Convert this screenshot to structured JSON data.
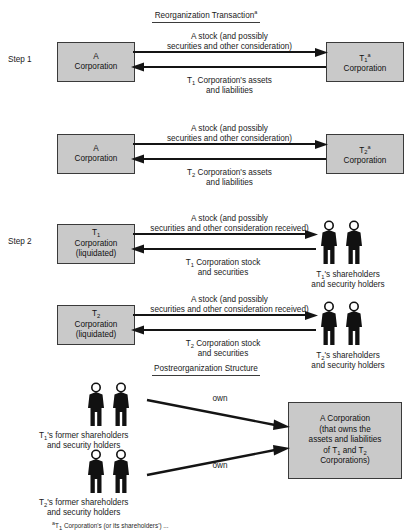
{
  "diagram": {
    "title_top": "Reorganization Transaction",
    "title_top_mark": "a",
    "title_bottom": "Postreorganization Structure",
    "step1_label": "Step 1",
    "step2_label": "Step 2"
  },
  "boxes": {
    "a_corp_1": {
      "line1": "A",
      "line2": "Corporation"
    },
    "a_corp_2": {
      "line1": "A",
      "line2": "Corporation"
    },
    "t1_corp": {
      "line1_base": "T",
      "line1_sub": "1",
      "line1_mark": "a",
      "line2": "Corporation"
    },
    "t2_corp": {
      "line1_base": "T",
      "line1_sub": "2",
      "line1_mark": "a",
      "line2": "Corporation"
    },
    "t1_liq": {
      "line1_base": "T",
      "line1_sub": "1",
      "line2": "Corporation",
      "line3": "(liquidated)"
    },
    "t2_liq": {
      "line1_base": "T",
      "line1_sub": "2",
      "line2": "Corporation",
      "line3": "(liquidated)"
    },
    "a_corp_post": {
      "line1": "A Corporation",
      "line2": "(that owns the",
      "line3": "assets and liabilities",
      "line4_pre": "of T",
      "line4_sub1": "1",
      "line4_mid": " and T",
      "line4_sub2": "2",
      "line5": "Corporations)"
    }
  },
  "captions": {
    "row1_top_l1": "A stock (and possibly",
    "row1_top_l2": "securities and other consideration)",
    "row1_bottom_l1_pre": "T",
    "row1_bottom_l1_sub": "1",
    "row1_bottom_l1_post": " Corporation's assets",
    "row1_bottom_l2": "and liabilities",
    "row2_top_l1": "A stock (and possibly",
    "row2_top_l2": "securities and other consideration)",
    "row2_bottom_l1_pre": "T",
    "row2_bottom_l1_sub": "2",
    "row2_bottom_l1_post": " Corporation's assets",
    "row2_bottom_l2": "and liabilities",
    "row3_top_l1": "A stock (and possibly",
    "row3_top_l2": "securities and other consideration received)",
    "row3_bottom_l1_pre": "T",
    "row3_bottom_l1_sub": "1",
    "row3_bottom_l1_post": " Corporation stock",
    "row3_bottom_l2": "and securities",
    "row4_top_l1": "A stock (and possibly",
    "row4_top_l2": "securities and other consideration received)",
    "row4_bottom_l1_pre": "T",
    "row4_bottom_l1_sub": "2",
    "row4_bottom_l1_post": " Corporation stock",
    "row4_bottom_l2": "and securities",
    "own_1": "own",
    "own_2": "own"
  },
  "people": {
    "t1_holders_l1_pre": "T",
    "t1_holders_l1_sub": "1",
    "t1_holders_l1_post": "'s shareholders",
    "t1_holders_l2": "and security holders",
    "t2_holders_l1_pre": "T",
    "t2_holders_l1_sub": "2",
    "t2_holders_l1_post": "'s shareholders",
    "t2_holders_l2": "and security holders",
    "t1_former_l1_pre": "T",
    "t1_former_l1_sub": "1",
    "t1_former_l1_post": "'s former shareholders",
    "t1_former_l2": "and security holders",
    "t2_former_l1_pre": "T",
    "t2_former_l1_sub": "2",
    "t2_former_l1_post": "'s former shareholders",
    "t2_former_l2": "and security holders"
  },
  "footnote": {
    "mark": "a",
    "text_pre": "T",
    "text_sub": "1",
    "text_post": " Corporation's (or its shareholders') ..."
  },
  "colors": {
    "box_fill": "#c9c9c9",
    "box_border": "#3a3a3a",
    "ink": "#1a1a1a",
    "arrow": "#141414",
    "person": "#111111",
    "background": "#ffffff"
  }
}
